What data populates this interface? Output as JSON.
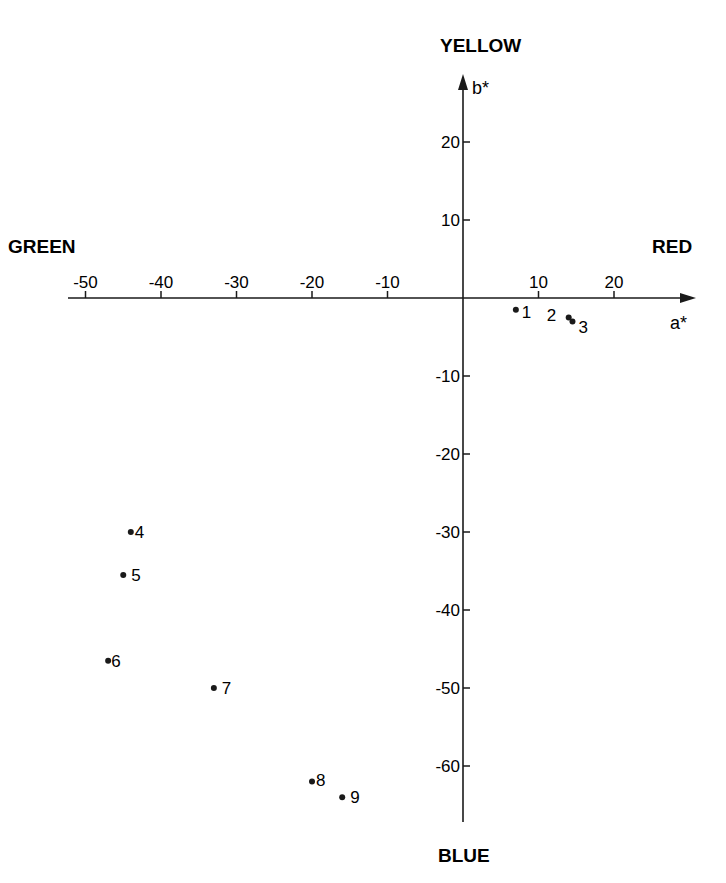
{
  "chart_data": {
    "type": "scatter",
    "title": "",
    "xlabel": "a*",
    "ylabel": "b*",
    "direction_labels": {
      "top": "YELLOW",
      "bottom": "BLUE",
      "left": "GREEN",
      "right": "RED"
    },
    "x_ticks": [
      -50,
      -40,
      -30,
      -20,
      -10,
      10,
      20
    ],
    "y_ticks": [
      20,
      10,
      -10,
      -20,
      -30,
      -40,
      -50,
      -60
    ],
    "xlim": [
      -53,
      31
    ],
    "ylim": [
      -67,
      28
    ],
    "grid": false,
    "legend": "none",
    "points": [
      {
        "label": "1",
        "a": 7,
        "b": -1.5
      },
      {
        "label": "2",
        "a": 14,
        "b": -2.5
      },
      {
        "label": "3",
        "a": 14.5,
        "b": -3
      },
      {
        "label": "4",
        "a": -44,
        "b": -30
      },
      {
        "label": "5",
        "a": -45,
        "b": -35.5
      },
      {
        "label": "6",
        "a": -47,
        "b": -46.5
      },
      {
        "label": "7",
        "a": -33,
        "b": -50
      },
      {
        "label": "8",
        "a": -20,
        "b": -62
      },
      {
        "label": "9",
        "a": -16,
        "b": -64
      }
    ]
  },
  "labels": {
    "yellow": "YELLOW",
    "blue": "BLUE",
    "green": "GREEN",
    "red": "RED",
    "x_axis": "a*",
    "y_axis": "b*"
  }
}
